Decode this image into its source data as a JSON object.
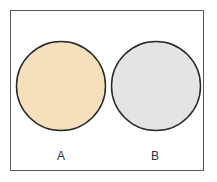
{
  "diagram": {
    "type": "two-set-disjoint",
    "sets": [
      {
        "label": "A",
        "fill": "#f6dfbb",
        "stroke": "#2a2a2a"
      },
      {
        "label": "B",
        "fill": "#e4e4e4",
        "stroke": "#2a2a2a"
      }
    ],
    "frame_color": "#5a5a5a"
  }
}
